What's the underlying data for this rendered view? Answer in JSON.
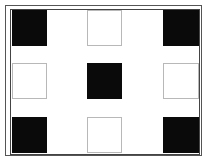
{
  "diagram": {
    "type": "3x3 grid pattern",
    "colors": {
      "filled": "#0a0a0a",
      "outline": "#b8b8b8",
      "frame": "#444444",
      "background": "#ffffff"
    },
    "cells": [
      {
        "row": 0,
        "col": 0,
        "style": "filled",
        "x": 12,
        "y": 10,
        "w": 35,
        "h": 36
      },
      {
        "row": 0,
        "col": 1,
        "style": "outlined",
        "x": 87,
        "y": 10,
        "w": 35,
        "h": 36
      },
      {
        "row": 0,
        "col": 2,
        "style": "filled",
        "x": 163,
        "y": 10,
        "w": 36,
        "h": 36
      },
      {
        "row": 1,
        "col": 0,
        "style": "outlined",
        "x": 12,
        "y": 63,
        "w": 35,
        "h": 36
      },
      {
        "row": 1,
        "col": 1,
        "style": "filled",
        "x": 87,
        "y": 63,
        "w": 35,
        "h": 36
      },
      {
        "row": 1,
        "col": 2,
        "style": "outlined",
        "x": 163,
        "y": 63,
        "w": 36,
        "h": 36
      },
      {
        "row": 2,
        "col": 0,
        "style": "filled",
        "x": 12,
        "y": 117,
        "w": 35,
        "h": 36
      },
      {
        "row": 2,
        "col": 1,
        "style": "outlined",
        "x": 87,
        "y": 117,
        "w": 35,
        "h": 36
      },
      {
        "row": 2,
        "col": 2,
        "style": "filled",
        "x": 163,
        "y": 117,
        "w": 36,
        "h": 36
      }
    ]
  }
}
